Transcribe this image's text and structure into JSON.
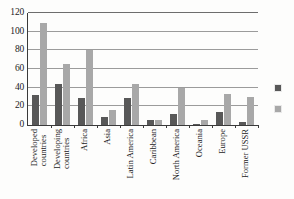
{
  "chart_data": {
    "type": "bar",
    "title": "",
    "subtitle": "",
    "xlabel": "",
    "ylabel": "",
    "ylim": [
      0,
      120
    ],
    "ytick_labels": [
      "120",
      "100",
      "80",
      "60",
      "40",
      "20",
      "0"
    ],
    "ytick_values": [
      120,
      100,
      80,
      60,
      40,
      20,
      0
    ],
    "grid": true,
    "legend_position": "right",
    "categories": [
      "Developed countries",
      "Developing countries",
      "Africa",
      "Asia",
      "Latin America",
      "Caribbean",
      "North America",
      "Oceania",
      "Europe",
      "Former USSR"
    ],
    "category_lines": [
      [
        "Developed",
        "countries"
      ],
      [
        "Developing",
        "countries"
      ],
      [
        "Africa"
      ],
      [
        "Asia"
      ],
      [
        "Latin America"
      ],
      [
        "Caribbean"
      ],
      [
        "North America"
      ],
      [
        "Oceania"
      ],
      [
        "Europe"
      ],
      [
        "Former USSR"
      ]
    ],
    "series": [
      {
        "name": "",
        "color": "#585858",
        "values": [
          32,
          44,
          29,
          9,
          29,
          5,
          12,
          1.5,
          14,
          3
        ]
      },
      {
        "name": "",
        "color": "#a8a8a8",
        "values": [
          109,
          65,
          80,
          16,
          44,
          5,
          40,
          5,
          33,
          30
        ]
      }
    ]
  },
  "legend": {
    "items": [
      {
        "swatch": "dark-gray-swatch",
        "label": ""
      },
      {
        "swatch": "light-gray-swatch",
        "label": ""
      }
    ]
  }
}
